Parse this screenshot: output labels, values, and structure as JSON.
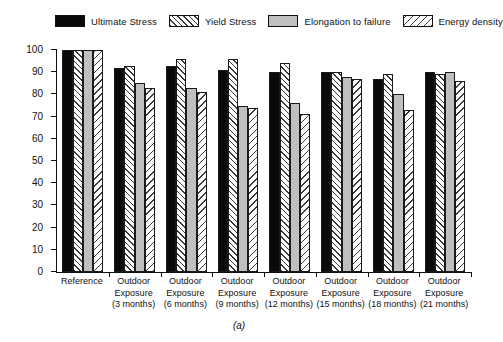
{
  "figure": {
    "caption": "(a)"
  },
  "chart_data": {
    "type": "bar",
    "title": "",
    "xlabel": "",
    "ylabel": "Residual tensile properties values (in %)",
    "ylim": [
      0,
      100
    ],
    "ytick_values": [
      0,
      10,
      20,
      30,
      40,
      50,
      60,
      70,
      80,
      90,
      100
    ],
    "ytick_labels": [
      "0",
      "10",
      "20",
      "30",
      "40",
      "50",
      "60",
      "70",
      "80",
      "90",
      "100"
    ],
    "grid": false,
    "legend_position": "top",
    "categories": [
      "Reference",
      "Outdoor Exposure (3 months)",
      "Outdoor Exposure (6 months)",
      "Outdoor Exposure (9 months)",
      "Outdoor Exposure (12 months)",
      "Outdoor Exposure (15 months)",
      "Outdoor Exposure (18 months)",
      "Outdoor Exposure (21 months)"
    ],
    "category_lines": [
      [
        "Reference"
      ],
      [
        "Outdoor",
        "Exposure",
        "(3 months)"
      ],
      [
        "Outdoor",
        "Exposure",
        "(6 months)"
      ],
      [
        "Outdoor",
        "Exposure",
        "(9 months)"
      ],
      [
        "Outdoor",
        "Exposure",
        "(12 months)"
      ],
      [
        "Outdoor",
        "Exposure",
        "(15 months)"
      ],
      [
        "Outdoor",
        "Exposure",
        "(18 months)"
      ],
      [
        "Outdoor",
        "Exposure",
        "(21 months)"
      ]
    ],
    "series": [
      {
        "name": "Ultimate Stress",
        "fill": "solid",
        "color": "#0a0a0a",
        "values": [
          100,
          92,
          93,
          91,
          90,
          90,
          87,
          90
        ]
      },
      {
        "name": "Yield Stress",
        "fill": "hatch-right",
        "color": "#ffffff",
        "values": [
          100,
          93,
          96,
          96,
          94,
          90,
          89,
          89
        ]
      },
      {
        "name": "Elongation to failure",
        "fill": "gray",
        "color": "#bfbfbf",
        "values": [
          100,
          85,
          83,
          75,
          76,
          88,
          80,
          90
        ]
      },
      {
        "name": "Energy density",
        "fill": "hatch-left",
        "color": "#ffffff",
        "values": [
          100,
          83,
          81,
          74,
          71,
          87,
          73,
          86
        ]
      }
    ]
  }
}
